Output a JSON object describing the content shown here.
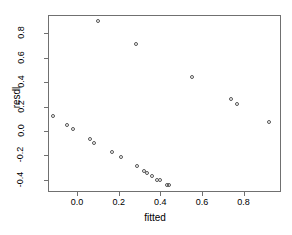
{
  "chart_data": {
    "type": "scatter",
    "title": "",
    "xlabel": "fitted",
    "ylabel": "resdl",
    "xlim": [
      -0.14,
      0.98
    ],
    "ylim": [
      -0.5,
      0.95
    ],
    "grid": false,
    "legend": null,
    "xticks": [
      "0.0",
      "0.2",
      "0.4",
      "0.6",
      "0.8"
    ],
    "xtick_values": [
      0.0,
      0.2,
      0.4,
      0.6,
      0.8
    ],
    "yticks": [
      "-0.4",
      "-0.2",
      "0.0",
      "0.2",
      "0.4",
      "0.6",
      "0.8"
    ],
    "ytick_values": [
      -0.4,
      -0.2,
      0.0,
      0.2,
      0.4,
      0.6,
      0.8
    ],
    "point_style": "open-circle",
    "point_color": "#555555",
    "n_points": 21,
    "x": [
      -0.115,
      -0.05,
      -0.02,
      0.06,
      0.08,
      0.1,
      0.17,
      0.21,
      0.285,
      0.29,
      0.32,
      0.335,
      0.36,
      0.385,
      0.4,
      0.43,
      0.44,
      0.55,
      0.74,
      0.77,
      0.92
    ],
    "y": [
      0.125,
      0.05,
      0.015,
      -0.065,
      -0.1,
      0.9,
      -0.175,
      -0.215,
      0.71,
      -0.29,
      -0.33,
      -0.345,
      -0.365,
      -0.4,
      -0.405,
      -0.44,
      -0.445,
      0.44,
      0.26,
      0.225,
      0.07
    ],
    "points": [
      {
        "x": -0.115,
        "y": 0.125
      },
      {
        "x": -0.05,
        "y": 0.05
      },
      {
        "x": -0.02,
        "y": 0.015
      },
      {
        "x": 0.06,
        "y": -0.065
      },
      {
        "x": 0.08,
        "y": -0.1
      },
      {
        "x": 0.1,
        "y": 0.9
      },
      {
        "x": 0.17,
        "y": -0.175
      },
      {
        "x": 0.21,
        "y": -0.215
      },
      {
        "x": 0.285,
        "y": 0.71
      },
      {
        "x": 0.29,
        "y": -0.29
      },
      {
        "x": 0.32,
        "y": -0.33
      },
      {
        "x": 0.335,
        "y": -0.345
      },
      {
        "x": 0.36,
        "y": -0.365
      },
      {
        "x": 0.385,
        "y": -0.4
      },
      {
        "x": 0.4,
        "y": -0.405
      },
      {
        "x": 0.43,
        "y": -0.44
      },
      {
        "x": 0.44,
        "y": -0.445
      },
      {
        "x": 0.55,
        "y": 0.44
      },
      {
        "x": 0.74,
        "y": 0.26
      },
      {
        "x": 0.77,
        "y": 0.225
      },
      {
        "x": 0.92,
        "y": 0.07
      }
    ]
  },
  "axes": {
    "x_title": "fitted",
    "y_title": "resdl"
  },
  "colors": {
    "frame": "#707070",
    "point": "#555555",
    "background": "#ffffff",
    "text": "#000000"
  }
}
